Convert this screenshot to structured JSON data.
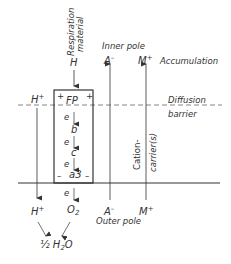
{
  "diagram": {
    "type": "membrane-redox-pump",
    "respiration_label": [
      "Respiration",
      "material"
    ],
    "substrate": "H",
    "carrier_chain": {
      "top": "FP",
      "steps": [
        "b",
        "c",
        "a3"
      ],
      "electron": "e",
      "top_charges": [
        "+",
        "+"
      ],
      "bottom_charges": [
        "–",
        "–"
      ]
    },
    "left_ion": {
      "top": "H",
      "top_sup": "+",
      "bottom": "H",
      "bottom_sup": "+"
    },
    "oxygen": {
      "label": "O",
      "sub": "2"
    },
    "water": {
      "prefix": "½ H",
      "sub": "2",
      "suffix": "O"
    },
    "anion": {
      "top": "A",
      "top_sup": "–",
      "bottom": "A",
      "bottom_sup": "–"
    },
    "cation": {
      "top": "M",
      "top_sup": "+",
      "bottom": "M",
      "bottom_sup": "+"
    },
    "inner_pole": "Inner pole",
    "outer_pole": "Outer pole",
    "accumulation": "Accumulation",
    "diffusion_barrier": [
      "Diffusion",
      "barrier"
    ],
    "cation_carrier": [
      "Cation-",
      "carrier(s)"
    ]
  }
}
